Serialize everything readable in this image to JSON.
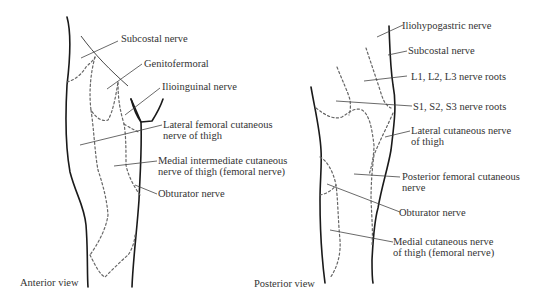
{
  "figure": {
    "panels": [
      {
        "id": "anterior",
        "view_label": "Anterior view",
        "labels": [
          {
            "key": "subcostal",
            "lines": [
              "Subcostal nerve"
            ]
          },
          {
            "key": "genitofemoral",
            "lines": [
              "Genitofermoral"
            ]
          },
          {
            "key": "ilioinguinal",
            "lines": [
              "Ilioinguinal nerve"
            ]
          },
          {
            "key": "lateral_femoral",
            "lines": [
              "Lateral femoral cutaneous",
              "nerve of thigh"
            ]
          },
          {
            "key": "medial_intermediate",
            "lines": [
              "Medial intermediate cutaneous",
              "nerve of thigh (femoral nerve)"
            ]
          },
          {
            "key": "obturator",
            "lines": [
              "Obturator nerve"
            ]
          }
        ]
      },
      {
        "id": "posterior",
        "view_label": "Posterior view",
        "labels": [
          {
            "key": "iliohypogastric",
            "lines": [
              "Iliohypogastric nerve"
            ]
          },
          {
            "key": "subcostal",
            "lines": [
              "Subcostal nerve"
            ]
          },
          {
            "key": "lumbar_roots",
            "lines": [
              "L1, L2, L3 nerve roots"
            ]
          },
          {
            "key": "sacral_roots",
            "lines": [
              "S1, S2, S3 nerve roots"
            ]
          },
          {
            "key": "lateral_cutaneous",
            "lines": [
              "Lateral cutaneous nerve",
              "of thigh"
            ]
          },
          {
            "key": "posterior_femoral",
            "lines": [
              "Posterior femoral cutaneous",
              "nerve"
            ]
          },
          {
            "key": "obturator",
            "lines": [
              "Obturator nerve"
            ]
          },
          {
            "key": "medial_cutaneous",
            "lines": [
              "Medial cutaneous nerve",
              "of thigh (femoral nerve)"
            ]
          }
        ]
      }
    ]
  }
}
